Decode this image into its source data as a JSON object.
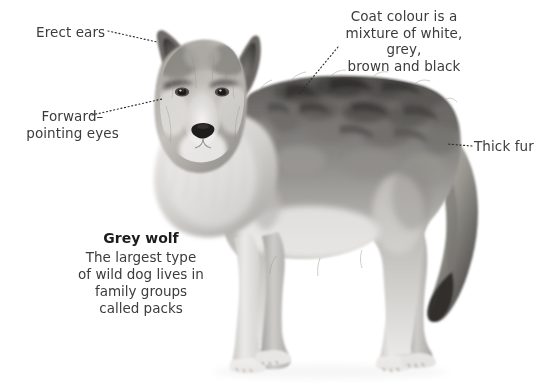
{
  "page": {
    "background_color": "#ffffff",
    "width": 546,
    "height": 383
  },
  "text_colors": {
    "label": "#3c3c3c",
    "caption_title": "#1c1c1c",
    "leader_line": "#2e2e2e"
  },
  "labels": {
    "erect_ears": "Erect ears",
    "forward_eyes": "Forward–\npointing eyes",
    "coat_colour": "Coat colour is a\nmixture of white, grey,\nbrown and black",
    "thick_fur": "Thick fur"
  },
  "caption": {
    "title": "Grey wolf",
    "body": "The largest type\nof wild dog lives in\nfamily groups\ncalled packs"
  },
  "leader_lines": [
    {
      "name": "erect-ears-leader",
      "from": [
        108,
        31
      ],
      "to": [
        157,
        42
      ]
    },
    {
      "name": "forward-eyes-leader",
      "from": [
        92,
        115
      ],
      "to": [
        162,
        99
      ]
    },
    {
      "name": "coat-colour-leader",
      "from": [
        338,
        47
      ],
      "to": [
        299,
        94
      ]
    },
    {
      "name": "thick-fur-leader",
      "from": [
        472,
        146
      ],
      "to": [
        447,
        144
      ]
    }
  ],
  "artwork": {
    "name": "grey-wolf",
    "description": "Greyscale photograph of a grey wolf standing, facing the viewer with body turned to the right",
    "palette": {
      "fur_light": "#e8e7e5",
      "fur_mid": "#b5b3b0",
      "fur_dark": "#6f6d6b",
      "fur_darkest": "#3a3836",
      "muzzle_white": "#f3f2f1",
      "nose": "#23211f"
    }
  }
}
